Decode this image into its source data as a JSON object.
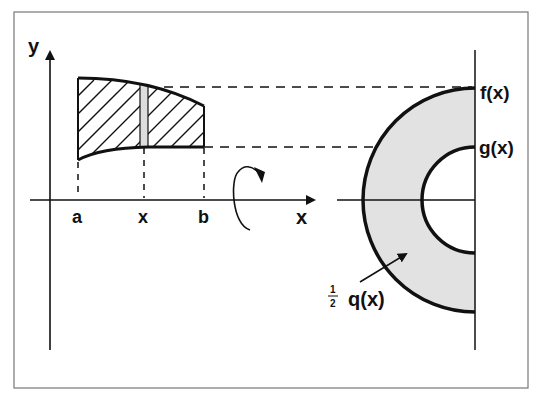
{
  "figure": {
    "colors": {
      "stroke": "#111111",
      "frame": "#777777",
      "washer_fill": "#e2e2e2",
      "strip_fill": "#dddddd"
    }
  },
  "left_plot": {
    "y_axis_label": "y",
    "x_axis_label": "x",
    "tick_labels": {
      "a": "a",
      "x": "x",
      "b": "b"
    },
    "rotation_icon": "rotation-arrow-about-x-axis"
  },
  "right_plot": {
    "outer_label": "f(x)",
    "inner_label": "g(x)",
    "area_label_fraction_num": "1",
    "area_label_fraction_den": "2",
    "area_label": "q(x)"
  }
}
